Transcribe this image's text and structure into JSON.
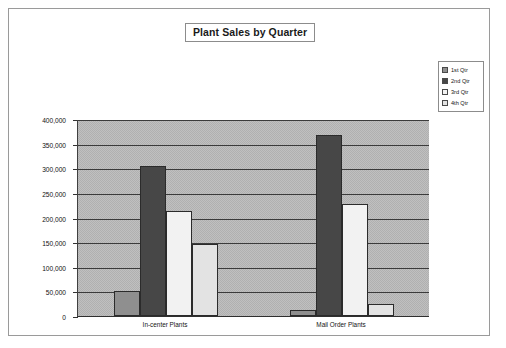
{
  "chart_data": {
    "type": "bar",
    "title": "Plant Sales by Quarter",
    "xlabel": "",
    "ylabel": "",
    "categories": [
      "In-center Plants",
      "Mail Order Plants"
    ],
    "series": [
      {
        "name": "1st Qtr",
        "values": [
          50000,
          12000
        ],
        "color": "#8f8f8f"
      },
      {
        "name": "2nd Qtr",
        "values": [
          305000,
          368000
        ],
        "color": "#474747"
      },
      {
        "name": "3rd Qtr",
        "values": [
          213000,
          227000
        ],
        "color": "#f2f2f2"
      },
      {
        "name": "4th Qtr",
        "values": [
          147000,
          25000
        ],
        "color": "#e3e3e3"
      }
    ],
    "ylim": [
      0,
      400000
    ],
    "ytick_labels": [
      "400,000",
      "350,000",
      "300,000",
      "250,000",
      "200,000",
      "150,000",
      "100,000",
      "50,000",
      "0"
    ],
    "ytick_values": [
      400000,
      350000,
      300000,
      250000,
      200000,
      150000,
      100000,
      50000,
      0
    ],
    "grid": true,
    "legend_position": "right",
    "plot_background": "#b0b0b0",
    "frame_border": "#9a9a9a"
  }
}
